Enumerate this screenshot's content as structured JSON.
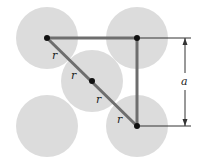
{
  "diagram": {
    "title": "",
    "colors": {
      "atom_fill": "#dcdcdc",
      "bond_line": "#6e6e6e",
      "center_dot": "#111111",
      "dimension_line": "#333333"
    },
    "atoms": [
      {
        "id": "top-left",
        "cx": 47,
        "cy": 38
      },
      {
        "id": "top-right",
        "cx": 137,
        "cy": 38
      },
      {
        "id": "center",
        "cx": 92,
        "cy": 81
      },
      {
        "id": "bottom-left",
        "cx": 47,
        "cy": 126
      },
      {
        "id": "bottom-right",
        "cx": 137,
        "cy": 126
      }
    ],
    "labels": {
      "r1": "r",
      "r2": "r",
      "r3": "r",
      "r4": "r",
      "a": "a"
    }
  }
}
